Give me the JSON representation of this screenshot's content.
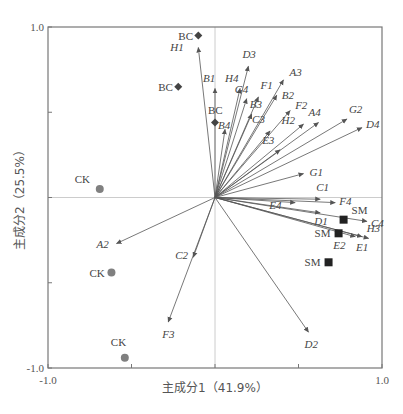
{
  "chart_data": {
    "type": "scatter",
    "subtype": "pca-biplot",
    "title": "",
    "xlabel": "主成分1（41.9%）",
    "ylabel": "主成分2（25.5%）",
    "xlim": [
      -1.0,
      1.0
    ],
    "ylim": [
      -1.0,
      1.0
    ],
    "x_ticks": [
      -1.0,
      -0.5,
      0,
      0.5,
      1.0
    ],
    "y_ticks": [
      -1.0,
      -0.5,
      0,
      0.5,
      1.0
    ],
    "x_tick_labels": [
      "-1.0",
      "1.0"
    ],
    "y_tick_labels": [
      "1.0",
      "-1.0"
    ],
    "grid": false,
    "zero_lines": true,
    "legend": null,
    "colors": {
      "axis": "#777777",
      "vector": "#555555",
      "zero_line": "#cccccc",
      "CK": "#808080",
      "BC": "#444444",
      "SM": "#222222"
    },
    "vectors": [
      {
        "name": "H1",
        "x": -0.1,
        "y": 0.88,
        "lx": -28,
        "ly": 4
      },
      {
        "name": "D3",
        "x": 0.2,
        "y": 0.77,
        "lx": -6,
        "ly": -8
      },
      {
        "name": "B1",
        "x": 0.0,
        "y": 0.64,
        "lx": -12,
        "ly": -6
      },
      {
        "name": "H4",
        "x": 0.15,
        "y": 0.64,
        "lx": -15,
        "ly": -6
      },
      {
        "name": "A3",
        "x": 0.41,
        "y": 0.69,
        "lx": 6,
        "ly": -4
      },
      {
        "name": "F1",
        "x": 0.26,
        "y": 0.59,
        "lx": 2,
        "ly": -8
      },
      {
        "name": "G4",
        "x": 0.19,
        "y": 0.58,
        "lx": -12,
        "ly": -6
      },
      {
        "name": "B2",
        "x": 0.37,
        "y": 0.6,
        "lx": 5,
        "ly": 4
      },
      {
        "name": "B3",
        "x": 0.22,
        "y": 0.49,
        "lx": -2,
        "ly": -6
      },
      {
        "name": "F2",
        "x": 0.45,
        "y": 0.51,
        "lx": 5,
        "ly": -2
      },
      {
        "name": "C3",
        "x": 0.33,
        "y": 0.39,
        "lx": -18,
        "ly": -8
      },
      {
        "name": "H2",
        "x": 0.53,
        "y": 0.43,
        "lx": -22,
        "ly": 0
      },
      {
        "name": "A4",
        "x": 0.62,
        "y": 0.44,
        "lx": -10,
        "ly": -6
      },
      {
        "name": "G2",
        "x": 0.79,
        "y": 0.46,
        "lx": 2,
        "ly": -6
      },
      {
        "name": "D4",
        "x": 0.88,
        "y": 0.41,
        "lx": 4,
        "ly": 0
      },
      {
        "name": "E3",
        "x": 0.39,
        "y": 0.28,
        "lx": -18,
        "ly": -6
      },
      {
        "name": "B4",
        "x": 0.06,
        "y": 0.4,
        "lx": -7,
        "ly": 0
      },
      {
        "name": "G1",
        "x": 0.53,
        "y": 0.14,
        "lx": 6,
        "ly": 2
      },
      {
        "name": "C1",
        "x": 0.63,
        "y": -0.01,
        "lx": -4,
        "ly": -8
      },
      {
        "name": "F4",
        "x": 0.72,
        "y": -0.03,
        "lx": 4,
        "ly": 2
      },
      {
        "name": "E4",
        "x": 0.48,
        "y": -0.03,
        "lx": -26,
        "ly": 6
      },
      {
        "name": "D1",
        "x": 0.63,
        "y": -0.09,
        "lx": -6,
        "ly": 12
      },
      {
        "name": "C4",
        "x": 0.91,
        "y": -0.14,
        "lx": 4,
        "ly": 6
      },
      {
        "name": "H3",
        "x": 0.92,
        "y": -0.24,
        "lx": -2,
        "ly": -6
      },
      {
        "name": "E1",
        "x": 0.88,
        "y": -0.23,
        "lx": -6,
        "ly": 14
      },
      {
        "name": "E2",
        "x": 0.84,
        "y": -0.23,
        "lx": -22,
        "ly": 12
      },
      {
        "name": "A2",
        "x": -0.59,
        "y": -0.27,
        "lx": -20,
        "ly": 4
      },
      {
        "name": "C2",
        "x": -0.13,
        "y": -0.35,
        "lx": -18,
        "ly": 2
      },
      {
        "name": "F3",
        "x": -0.28,
        "y": -0.73,
        "lx": -6,
        "ly": 16
      },
      {
        "name": "D2",
        "x": 0.56,
        "y": -0.79,
        "lx": -4,
        "ly": 16
      }
    ],
    "observations": [
      {
        "group": "BC",
        "shape": "diamond",
        "x": -0.1,
        "y": 0.95,
        "lx": -20,
        "ly": 4
      },
      {
        "group": "BC",
        "shape": "diamond",
        "x": -0.22,
        "y": 0.65,
        "lx": -20,
        "ly": 4
      },
      {
        "group": "BC",
        "shape": "diamond",
        "x": 0.0,
        "y": 0.44,
        "lx": -7,
        "ly": -8
      },
      {
        "group": "CK",
        "shape": "circle",
        "x": -0.69,
        "y": 0.05,
        "lx": -25,
        "ly": -6
      },
      {
        "group": "CK",
        "shape": "circle",
        "x": -0.62,
        "y": -0.44,
        "lx": -22,
        "ly": 4
      },
      {
        "group": "CK",
        "shape": "circle",
        "x": -0.54,
        "y": -0.94,
        "lx": -14,
        "ly": -12
      },
      {
        "group": "SM",
        "shape": "square",
        "x": 0.77,
        "y": -0.13,
        "lx": 8,
        "ly": -6
      },
      {
        "group": "SM",
        "shape": "square",
        "x": 0.74,
        "y": -0.21,
        "lx": -24,
        "ly": 4
      },
      {
        "group": "SM",
        "shape": "square",
        "x": 0.68,
        "y": -0.38,
        "lx": -24,
        "ly": 4
      }
    ]
  }
}
